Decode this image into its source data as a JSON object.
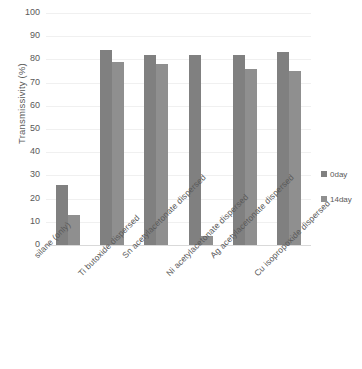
{
  "chart_data": {
    "type": "bar",
    "title": "",
    "xlabel": "",
    "ylabel": "Transmissivity (%)",
    "ylim": [
      0,
      100
    ],
    "ytick_values": [
      100,
      90,
      80,
      70,
      60,
      50,
      40,
      30,
      20,
      10,
      0
    ],
    "ytick_labels": [
      "100",
      "90",
      "80",
      "70",
      "60",
      "50",
      "40",
      "30",
      "20",
      "10",
      "0"
    ],
    "grid": true,
    "legend_position": "right",
    "categories": [
      "silane (only)",
      "Ti  butoxide dispersed",
      "Sn acetylacetonate dispersed",
      "Ni  acetylacetonate dispersed",
      "Ag acetylacetonate dispersed",
      "Cu isopropoxide dispersed"
    ],
    "series": [
      {
        "name": "0day",
        "color": "#808080",
        "values": [
          26,
          84,
          82,
          82,
          82,
          83
        ]
      },
      {
        "name": "14day",
        "color": "#8f8f8f",
        "values": [
          13,
          79,
          78,
          4,
          76,
          75
        ]
      }
    ],
    "legend_entries": [
      {
        "label": "0day",
        "color": "#808080"
      },
      {
        "label": "14day",
        "color": "#8f8f8f"
      }
    ]
  }
}
